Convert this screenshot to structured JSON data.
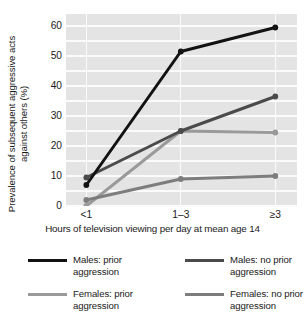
{
  "chart_data": {
    "type": "line",
    "title": "",
    "xlabel": "Hours of television viewing per day at mean age 14",
    "ylabel": "Prevalence of subsequent aggressive acts against others (%)",
    "ylabel_line1": "Prevalence of subsequent aggressive acts",
    "ylabel_line2": "against others (%)",
    "categories": [
      "<1",
      "1–3",
      "≥3"
    ],
    "yticks": [
      0,
      10,
      20,
      30,
      40,
      50,
      60
    ],
    "ylim": [
      0,
      64
    ],
    "grid": "horizontal-and-vertical",
    "legend_position": "below",
    "plot_background": "#e4e4e4",
    "gridline_color": "#fbfbfb",
    "series": [
      {
        "name": "Males: prior aggression",
        "name_line1": "Males: prior",
        "name_line2": "aggression",
        "color": "#121212",
        "values": [
          7,
          51.5,
          59.5
        ]
      },
      {
        "name": "Males: no prior aggression",
        "name_line1": "Males: no prior",
        "name_line2": "aggression",
        "color": "#4b4b4b",
        "values": [
          9.5,
          25,
          36.5
        ]
      },
      {
        "name": "Females: prior aggression",
        "name_line1": "Females: prior",
        "name_line2": "aggression",
        "color": "#9a9a9a",
        "values": [
          0,
          25,
          24.5
        ]
      },
      {
        "name": "Females: no prior aggression",
        "name_line1": "Females: no prior",
        "name_line2": "aggression",
        "color": "#7d7d7d",
        "values": [
          2,
          9,
          10
        ]
      }
    ]
  },
  "axis": {
    "ytick_labels": [
      "60",
      "50",
      "40",
      "30",
      "20",
      "10",
      "0"
    ],
    "xtick_labels": [
      "<1",
      "1–3",
      "≥3"
    ],
    "xtitle": "Hours of television viewing per day at mean age 14",
    "ytitle_line1": "Prevalence of subsequent aggressive acts",
    "ytitle_line2": "against others (%)"
  },
  "legend": {
    "entries": [
      {
        "label_line1": "Males: prior",
        "label_line2": "aggression",
        "color": "#121212"
      },
      {
        "label_line1": "Males: no prior",
        "label_line2": "aggression",
        "color": "#4b4b4b"
      },
      {
        "label_line1": "Females: prior",
        "label_line2": "aggression",
        "color": "#9a9a9a"
      },
      {
        "label_line1": "Females: no prior",
        "label_line2": "aggression",
        "color": "#7d7d7d"
      }
    ]
  }
}
